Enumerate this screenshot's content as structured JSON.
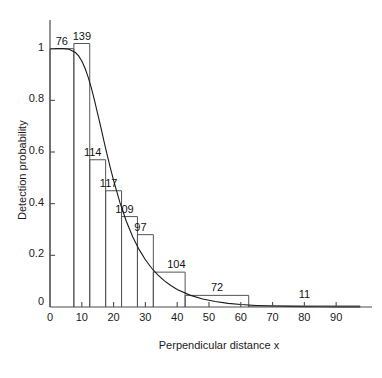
{
  "chart_data": {
    "type": "bar",
    "title": "",
    "subtitle": "",
    "xlabel": "Perpendicular distance x",
    "ylabel": "Detection probability",
    "xlim": [
      0,
      97.5
    ],
    "ylim": [
      0,
      1.08
    ],
    "grid": false,
    "legend": null,
    "xticks": [
      0,
      10,
      20,
      30,
      40,
      50,
      60,
      70,
      80,
      90
    ],
    "xticklabels": [
      "0",
      "10",
      "20",
      "30",
      "40",
      "50",
      "60",
      "70",
      "80",
      "90"
    ],
    "yticks": [
      0,
      0.2,
      0.4,
      0.6,
      0.8,
      1
    ],
    "yticklabels": [
      "0",
      "0.2",
      "0.4",
      "0.6",
      "0.8",
      "1"
    ],
    "bar_edges": [
      0,
      7.5,
      12.5,
      17.5,
      22.5,
      27.5,
      32.5,
      42.5,
      62.5,
      97.5
    ],
    "values": [
      1.0,
      1.02,
      0.57,
      0.45,
      0.35,
      0.28,
      0.135,
      0.045,
      0.004
    ],
    "bar_labels": [
      "76",
      "139",
      "114",
      "117",
      "109",
      "97",
      "104",
      "72",
      "11"
    ],
    "categories": [
      "0-7.5",
      "7.5-12.5",
      "12.5-17.5",
      "17.5-22.5",
      "22.5-27.5",
      "27.5-32.5",
      "32.5-42.5",
      "42.5-62.5",
      "62.5-97.5"
    ],
    "counts": [
      76,
      139,
      114,
      117,
      109,
      97,
      104,
      72,
      11
    ],
    "curve": {
      "name": "fitted detection function",
      "x": [
        0,
        2,
        4,
        6,
        8,
        9,
        10,
        11,
        12,
        13,
        14,
        15,
        16,
        17,
        18,
        19,
        20,
        22,
        24,
        26,
        28,
        30,
        32,
        34,
        36,
        38,
        40,
        44,
        48,
        52,
        56,
        60,
        65,
        70,
        75,
        80,
        85,
        90,
        95,
        97.5
      ],
      "y": [
        1.0,
        1.0,
        1.0,
        0.998,
        0.985,
        0.972,
        0.952,
        0.925,
        0.89,
        0.848,
        0.8,
        0.748,
        0.695,
        0.64,
        0.588,
        0.538,
        0.49,
        0.404,
        0.332,
        0.272,
        0.223,
        0.183,
        0.15,
        0.123,
        0.101,
        0.083,
        0.068,
        0.046,
        0.031,
        0.021,
        0.014,
        0.0095,
        0.006,
        0.0038,
        0.0024,
        0.0015,
        0.0009,
        0.0006,
        0.0004,
        0.0003
      ]
    },
    "colors": {
      "axis": "#4d4d4d",
      "bar_stroke": "#555555",
      "curve": "#1a1a1a",
      "text": "#1a1a1a",
      "background": "#ffffff"
    }
  }
}
